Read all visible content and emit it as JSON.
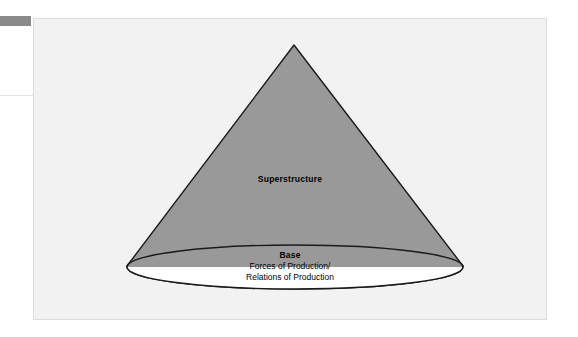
{
  "figure": {
    "type": "cone-diagram",
    "title_concept": "Base and Superstructure",
    "cone": {
      "fill_color": "#999999",
      "stroke_color": "#1a1a1a",
      "apex": {
        "x": 260,
        "y": 26
      },
      "base_left": {
        "x": 93,
        "y": 245
      },
      "base_right": {
        "x": 429,
        "y": 245
      }
    },
    "base_ellipse": {
      "fill_color": "#ffffff",
      "stroke_color": "#1a1a1a",
      "center": {
        "x": 261,
        "y": 248
      },
      "radius_x": 168,
      "radius_y": 22
    },
    "labels": {
      "superstructure": "Superstructure",
      "base_title": "Base",
      "base_line_1": "Forces of Production/",
      "base_line_2": "Relations of Production"
    }
  },
  "panel": {
    "background_color": "#f2f2f2",
    "border_color": "#dedede"
  },
  "artifacts": {
    "corner_bar_color": "#8a8a8a",
    "edge_rule_color": "#e3e3e3"
  }
}
